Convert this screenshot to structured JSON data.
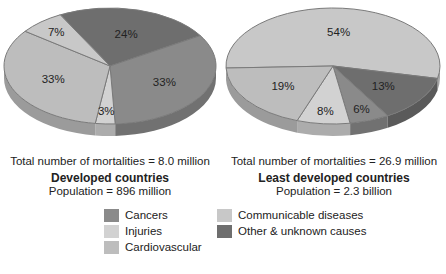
{
  "chart_data": [
    {
      "type": "pie",
      "title": "Developed countries",
      "total_label": "Total number of mortalities = 8.0 million",
      "subtitle": "Population = 896 million",
      "slices": [
        {
          "category": "Other & unknown causes",
          "value": 24,
          "label": "24%"
        },
        {
          "category": "Cancers",
          "value": 33,
          "label": "33%"
        },
        {
          "category": "Injuries",
          "value": 3,
          "label": "3%"
        },
        {
          "category": "Cardiovascular",
          "value": 33,
          "label": "33%"
        },
        {
          "category": "Communicable diseases",
          "value": 7,
          "label": "7%"
        }
      ]
    },
    {
      "type": "pie",
      "title": "Least developed countries",
      "total_label": "Total number of mortalities = 26.9 million",
      "subtitle": "Population = 2.3 billion",
      "slices": [
        {
          "category": "Communicable diseases",
          "value": 54,
          "label": "54%"
        },
        {
          "category": "Other & unknown causes",
          "value": 13,
          "label": "13%"
        },
        {
          "category": "Cancers",
          "value": 6,
          "label": "6%"
        },
        {
          "category": "Injuries",
          "value": 8,
          "label": "8%"
        },
        {
          "category": "Cardiovascular",
          "value": 19,
          "label": "19%"
        }
      ]
    }
  ],
  "legend": {
    "placement": "bottom",
    "items": [
      {
        "label": "Cancers",
        "color": "#8a8a8a"
      },
      {
        "label": "Injuries",
        "color": "#d2d2d2"
      },
      {
        "label": "Cardiovascular",
        "color": "#bdbdbd"
      },
      {
        "label": "Communicable diseases",
        "color": "#c8c8c8"
      },
      {
        "label": "Other & unknown causes",
        "color": "#6e6e6e"
      }
    ]
  },
  "colors": {
    "Cancers": "#8a8a8a",
    "Injuries": "#d2d2d2",
    "Cardiovascular": "#bdbdbd",
    "Communicable diseases": "#c8c8c8",
    "Other & unknown causes": "#6e6e6e"
  }
}
